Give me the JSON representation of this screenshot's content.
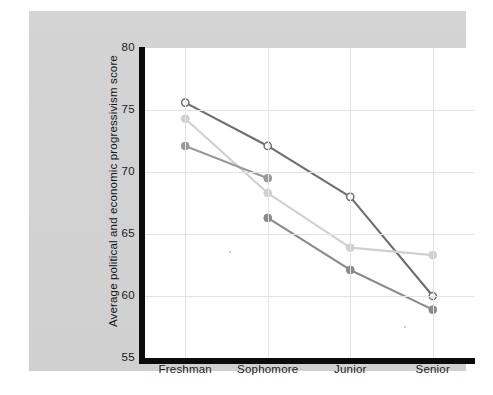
{
  "chart_data": {
    "type": "line",
    "title": "",
    "subtitle": "",
    "xlabel": "",
    "ylabel": "Average political and economic progressivism score",
    "categories": [
      "Freshman",
      "Sophomore",
      "Junior",
      "Senior"
    ],
    "ytick_labels": [
      "80",
      "75",
      "70",
      "65",
      "60",
      "55"
    ],
    "ytick_values": [
      80,
      75,
      70,
      65,
      60,
      55
    ],
    "ylim": [
      55,
      80
    ],
    "grid": "horizontal-and-vertical",
    "legend": "none",
    "series": [
      {
        "name": "series-1-open-circle-dark",
        "marker": "open-circle",
        "color": "#6e6e6e",
        "fill": "#ffffff",
        "values": [
          75.6,
          72.1,
          68.0,
          60.0
        ]
      },
      {
        "name": "series-2-light-gray",
        "marker": "filled-circle",
        "color": "#d0d0d0",
        "fill": "#d0d0d0",
        "values": [
          74.3,
          68.3,
          63.9,
          63.3
        ]
      },
      {
        "name": "series-3-medium-gray",
        "marker": "filled-circle",
        "color": "#9a9a9a",
        "fill": "#9a9a9a",
        "values": [
          72.1,
          69.5,
          null,
          null
        ]
      },
      {
        "name": "series-4-dark-gray",
        "marker": "filled-circle",
        "color": "#8a8a8a",
        "fill": "#8a8a8a",
        "values": [
          null,
          66.3,
          62.1,
          58.9
        ]
      }
    ],
    "colors": {
      "figure_background": "#d2d2d2",
      "plot_background": "#ffffff",
      "axis": "#0b0b0b",
      "gridline": "#e3e3e3",
      "text": "#1b1b1b"
    }
  }
}
